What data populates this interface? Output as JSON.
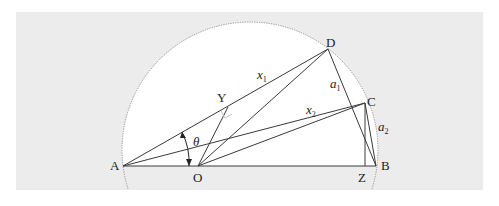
{
  "diagram": {
    "colors": {
      "background_page": "#ffffff",
      "background_panel": "#ececec",
      "semicircle_fill": "#ffffff",
      "line": "#3a3a3a",
      "arc_dotted": "#8a8a8a"
    },
    "points": {
      "A": {
        "label": "A",
        "x": 123,
        "y": 166
      },
      "B": {
        "label": "B",
        "x": 376,
        "y": 166
      },
      "O": {
        "label": "O",
        "x": 198,
        "y": 166
      },
      "D": {
        "label": "D",
        "x": 328,
        "y": 49
      },
      "C": {
        "label": "C",
        "x": 365,
        "y": 103
      },
      "Y": {
        "label": "Y",
        "x": 228,
        "y": 107
      },
      "Z": {
        "label": "Z",
        "x": 365,
        "y": 166
      }
    },
    "segment_labels": {
      "x1": {
        "base": "x",
        "sub": "1"
      },
      "x2": {
        "base": "x",
        "sub": "2"
      },
      "a1": {
        "base": "a",
        "sub": "1"
      },
      "a2": {
        "base": "a",
        "sub": "2"
      }
    },
    "angle_label": "θ"
  }
}
